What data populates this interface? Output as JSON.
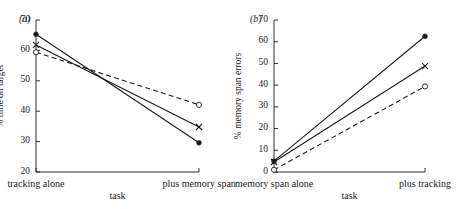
{
  "figure": {
    "background": "#ffffff",
    "ink": "#1a1a1a"
  },
  "chart_data": [
    {
      "type": "line",
      "panel_tag": "(a)",
      "title": "",
      "xlabel": "task",
      "ylabel": "% time on target",
      "categories": [
        "tracking alone",
        "plus memory span"
      ],
      "x": [
        0,
        1
      ],
      "xlim": [
        -0.08,
        1.08
      ],
      "ylim": [
        20,
        70
      ],
      "yticks": [
        20,
        30,
        40,
        50,
        60,
        70
      ],
      "ytick_labels": [
        "20",
        "30",
        "40",
        "50",
        "60",
        "70"
      ],
      "grid": false,
      "legend": "none",
      "series": [
        {
          "name": "filled-circle-solid",
          "marker": "filled-circle",
          "linestyle": "solid",
          "color": "#1a1a1a",
          "values": [
            65.3,
            29.6
          ]
        },
        {
          "name": "cross-solid",
          "marker": "cross",
          "linestyle": "solid",
          "color": "#1a1a1a",
          "values": [
            61.8,
            34.8
          ]
        },
        {
          "name": "open-circle-dashed",
          "marker": "open-circle",
          "linestyle": "dashed",
          "color": "#1a1a1a",
          "values": [
            59.4,
            42.1
          ]
        }
      ]
    },
    {
      "type": "line",
      "panel_tag": "(b)",
      "title": "",
      "xlabel": "task",
      "ylabel": "% memory span errors",
      "categories": [
        "memory span alone",
        "plus tracking"
      ],
      "x": [
        0,
        1
      ],
      "xlim": [
        -0.08,
        1.08
      ],
      "ylim": [
        0,
        70
      ],
      "yticks": [
        0,
        10,
        20,
        30,
        40,
        50,
        60,
        70
      ],
      "ytick_labels": [
        "0",
        "10",
        "20",
        "30",
        "40",
        "50",
        "60",
        "70"
      ],
      "grid": false,
      "legend": "none",
      "series": [
        {
          "name": "filled-circle-solid",
          "marker": "filled-circle",
          "linestyle": "solid",
          "color": "#1a1a1a",
          "values": [
            5.0,
            62.5
          ]
        },
        {
          "name": "cross-solid",
          "marker": "cross",
          "linestyle": "solid",
          "color": "#1a1a1a",
          "values": [
            4.6,
            48.8
          ]
        },
        {
          "name": "open-circle-dashed",
          "marker": "open-circle",
          "linestyle": "dashed",
          "color": "#1a1a1a",
          "values": [
            1.0,
            39.4
          ]
        }
      ]
    }
  ]
}
